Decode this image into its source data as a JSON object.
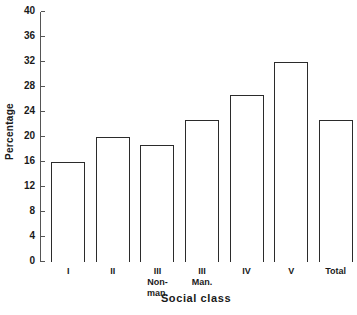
{
  "chart_data": {
    "type": "bar",
    "title": "",
    "xlabel": "Social class",
    "ylabel": "Percentage",
    "ylim": [
      0,
      40
    ],
    "ytick_step": 4,
    "yticks": [
      0,
      4,
      8,
      12,
      16,
      20,
      24,
      28,
      32,
      36,
      40
    ],
    "grid": false,
    "legend": "none",
    "bar_style": "outlined-hollow",
    "categories": [
      "I",
      "II",
      "III\nNon-\nman.",
      "III\nMan.",
      "IV",
      "V",
      "Total"
    ],
    "values": [
      16.0,
      20.0,
      18.7,
      22.8,
      26.8,
      32.0,
      22.8
    ],
    "series": [
      {
        "name": "Percentage",
        "values": [
          16.0,
          20.0,
          18.7,
          22.8,
          26.8,
          32.0,
          22.8
        ]
      }
    ]
  },
  "colors": {
    "bar_outline": "#2b2b2b",
    "axis": "#555555",
    "text": "#1a1a1a",
    "background": "#ffffff"
  }
}
